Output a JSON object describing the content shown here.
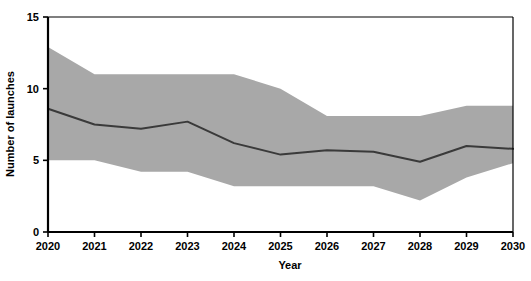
{
  "chart_data": {
    "type": "area",
    "title": "",
    "subtitle": "",
    "xlabel": "Year",
    "ylabel": "Number of launches",
    "categories": [
      "2020",
      "2021",
      "2022",
      "2023",
      "2024",
      "2025",
      "2026",
      "2027",
      "2028",
      "2029",
      "2030"
    ],
    "x": [
      2020,
      2021,
      2022,
      2023,
      2024,
      2025,
      2026,
      2027,
      2028,
      2029,
      2030
    ],
    "xlim": [
      2020,
      2030
    ],
    "ylim": [
      0,
      15
    ],
    "xticks": [
      2020,
      2021,
      2022,
      2023,
      2024,
      2025,
      2026,
      2027,
      2028,
      2029,
      2030
    ],
    "yticks": [
      0,
      5,
      10,
      15
    ],
    "xtick_labels": [
      "2020",
      "2021",
      "2022",
      "2023",
      "2024",
      "2025",
      "2026",
      "2027",
      "2028",
      "2029",
      "2030"
    ],
    "ytick_labels": [
      "0",
      "5",
      "10",
      "15"
    ],
    "grid": false,
    "legend": "none",
    "series": [
      {
        "name": "Median projection",
        "kind": "line",
        "color": "#3a3a3a",
        "values": [
          8.6,
          7.5,
          7.2,
          7.7,
          6.2,
          5.4,
          5.7,
          5.6,
          4.9,
          6.0,
          5.8
        ]
      },
      {
        "name": "Uncertainty band upper",
        "kind": "band-upper",
        "color": "#a8a8a8",
        "values": [
          12.9,
          11.0,
          11.0,
          11.0,
          11.0,
          10.0,
          8.1,
          8.1,
          8.1,
          8.8,
          8.8
        ]
      },
      {
        "name": "Uncertainty band lower",
        "kind": "band-lower",
        "color": "#a8a8a8",
        "values": [
          5.0,
          5.0,
          4.2,
          4.2,
          3.2,
          3.2,
          3.2,
          3.2,
          2.2,
          3.8,
          4.8
        ]
      }
    ],
    "colors": {
      "band_fill": "#a8a8a8",
      "line": "#3a3a3a",
      "axis": "#000000",
      "background": "#ffffff",
      "text": "#000000"
    }
  }
}
